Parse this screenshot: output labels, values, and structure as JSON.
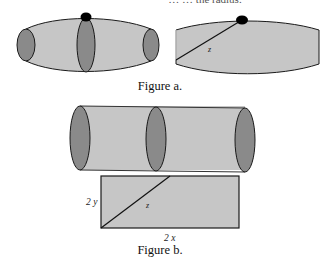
{
  "top_text_fragment": "… … the radius.",
  "figure_a": {
    "caption": "Figure a.",
    "right_label_z": "z"
  },
  "figure_b": {
    "caption": "Figure b.",
    "label_height": "2 y",
    "label_width": "2 x",
    "label_diagonal": "z"
  },
  "colors": {
    "body_fill": "#c6c6c6",
    "end_fill": "#8a8a8a",
    "stroke": "#1a1a1a",
    "dot": "#000000"
  }
}
